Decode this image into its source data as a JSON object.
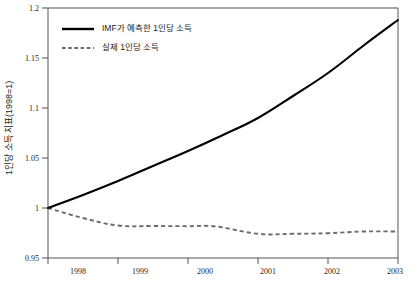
{
  "chart_data": {
    "type": "line",
    "title": "",
    "xlabel": "",
    "ylabel": "1인당 소득 지표(1998=1)",
    "xlim": [
      1998,
      2003
    ],
    "ylim": [
      0.95,
      1.2
    ],
    "grid": false,
    "legend_position": "top-left",
    "x": [
      1998,
      1999,
      2000,
      2001,
      2002,
      2003
    ],
    "categories": [
      "1998",
      "1999",
      "2000",
      "2001",
      "2002",
      "2003"
    ],
    "xtick_labels": [
      "1998",
      "1999",
      "2000",
      "2001",
      "2002",
      "2003"
    ],
    "ytick_labels": [
      "0.95",
      "1",
      "1.05",
      "1.1",
      "1.15",
      "1.2"
    ],
    "ytick_values": [
      0.95,
      1.0,
      1.05,
      1.1,
      1.15,
      1.2
    ],
    "series": [
      {
        "name": "IMF가 예측한 1인당 소득",
        "style": "solid",
        "color": "#000000",
        "x": [
          1998.0,
          1998.5,
          1999.0,
          1999.5,
          2000.0,
          2000.5,
          2001.0,
          2001.5,
          2002.0,
          2002.5,
          2003.0
        ],
        "values": [
          1.0,
          1.013,
          1.027,
          1.042,
          1.057,
          1.073,
          1.09,
          1.112,
          1.135,
          1.162,
          1.188
        ]
      },
      {
        "name": "실제 1인당 소득",
        "style": "dashed",
        "color": "#6b6b6b",
        "x": [
          1998.0,
          1998.5,
          1999.0,
          1999.5,
          2000.0,
          2000.4,
          2001.0,
          2001.5,
          2002.0,
          2002.5,
          2003.0
        ],
        "values": [
          1.0,
          0.99,
          0.9825,
          0.982,
          0.9818,
          0.9815,
          0.9742,
          0.9742,
          0.9748,
          0.9765,
          0.9765
        ]
      }
    ],
    "annotations": []
  },
  "legend": {
    "entries": [
      {
        "label": "IMF가 예측한 1인당 소득",
        "style": "solid"
      },
      {
        "label": "실제 1인당 소득",
        "style": "dashed"
      }
    ]
  },
  "axis": {
    "y_title": "1인당 소득 지표(1998=1)",
    "y_ticks": [
      "1.2",
      "1.15",
      "1.1",
      "1.05",
      "1",
      "0.95"
    ],
    "x_ticks": [
      "1998",
      "1999",
      "2000",
      "2001",
      "2002",
      "2003"
    ]
  }
}
